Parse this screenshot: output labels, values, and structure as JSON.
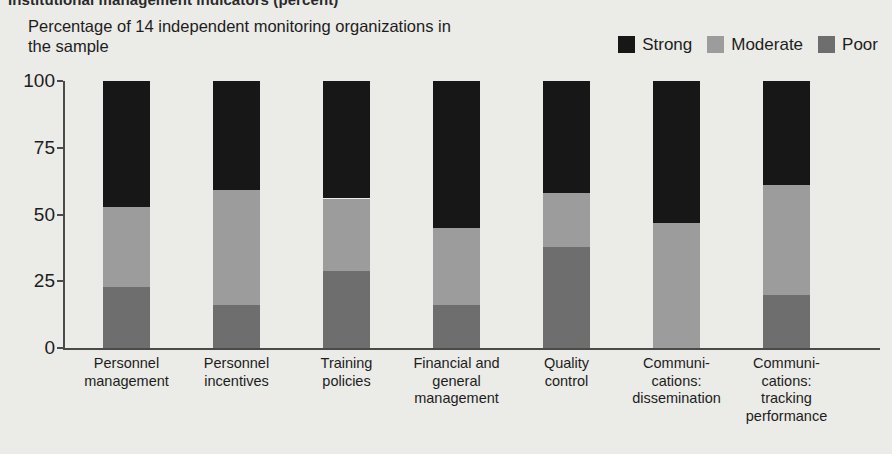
{
  "figure": {
    "top_title": "Institutional management indicators (percent)",
    "subtitle": "Percentage of 14 independent monitoring organizations in the sample"
  },
  "legend": {
    "position": "top-right",
    "items": [
      {
        "label": "Strong",
        "color": "#171717"
      },
      {
        "label": "Moderate",
        "color": "#9c9c9c"
      },
      {
        "label": "Poor",
        "color": "#6e6e6e"
      }
    ]
  },
  "axes": {
    "yticks": [
      "100",
      "75",
      "50",
      "25",
      "0"
    ],
    "ytick_values": [
      100,
      75,
      50,
      25,
      0
    ]
  },
  "chart_data": {
    "type": "bar",
    "title": "Institutional management indicators (percent)",
    "subtitle": "Percentage of 14 independent monitoring organizations in the sample",
    "stacked": true,
    "orientation": "vertical",
    "xlabel": "",
    "ylabel": "Percentage of 14 independent monitoring organizations in the sample",
    "ylim": [
      0,
      100
    ],
    "yticks": [
      0,
      25,
      50,
      75,
      100
    ],
    "grid": false,
    "legend_position": "top-right",
    "categories": [
      "Personnel management",
      "Personnel incentives",
      "Training policies",
      "Financial and general management",
      "Quality control",
      "Communications: dissemination",
      "Communications: tracking performance"
    ],
    "category_lines": [
      [
        "Personnel",
        "management"
      ],
      [
        "Personnel",
        "incentives"
      ],
      [
        "Training",
        "policies"
      ],
      [
        "Financial and",
        "general",
        "management"
      ],
      [
        "Quality",
        "control"
      ],
      [
        "Communi-",
        "cations:",
        "dissemination"
      ],
      [
        "Communi-",
        "cations:",
        "tracking",
        "performance"
      ]
    ],
    "series": [
      {
        "name": "Poor",
        "color": "#6e6e6e",
        "values": [
          23,
          16,
          29,
          16,
          38,
          0,
          20
        ]
      },
      {
        "name": "Moderate",
        "color": "#9c9c9c",
        "values": [
          30,
          43,
          27,
          29,
          20,
          47,
          41
        ]
      },
      {
        "name": "Strong",
        "color": "#171717",
        "values": [
          47,
          41,
          44,
          55,
          42,
          53,
          39
        ]
      }
    ]
  }
}
